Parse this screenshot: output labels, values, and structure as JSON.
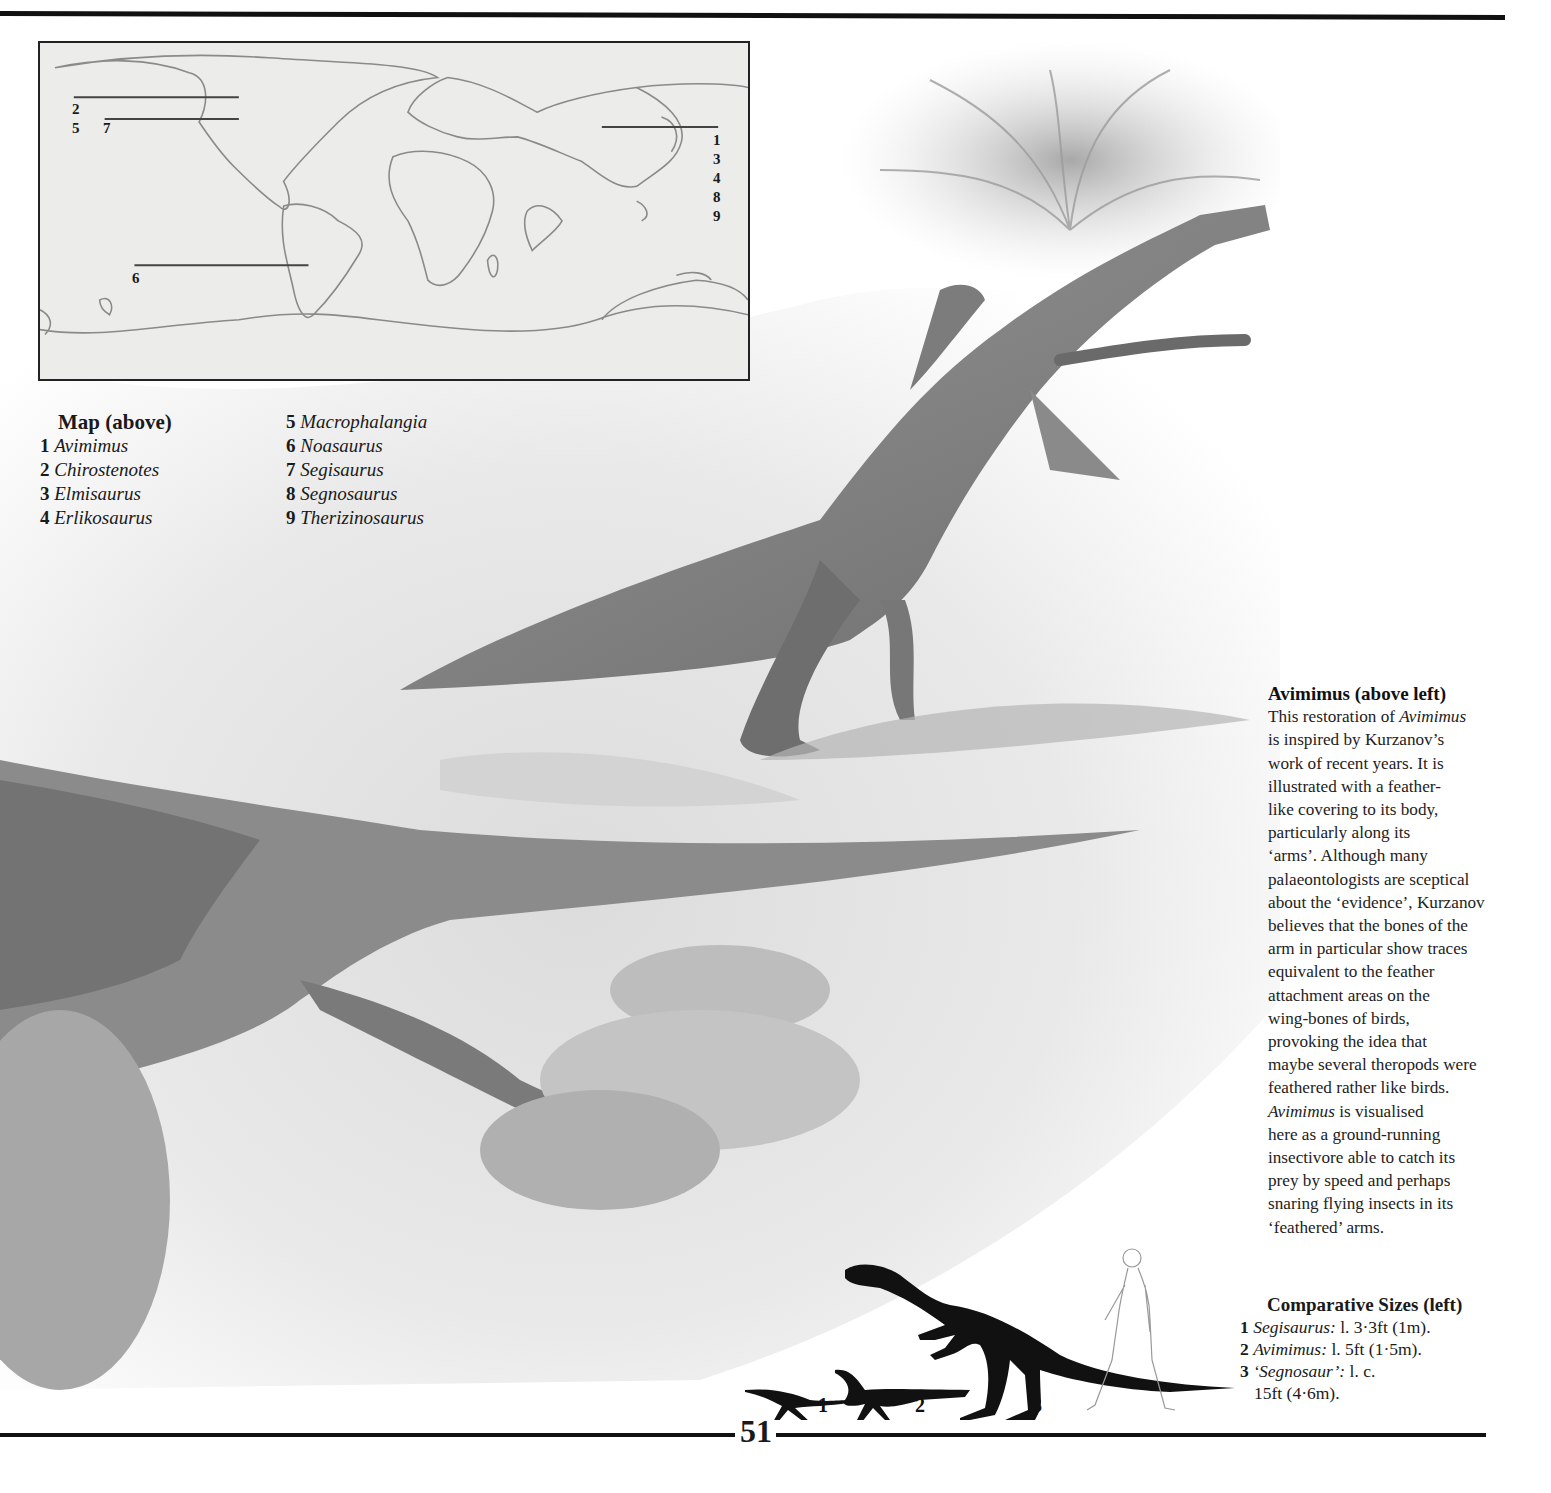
{
  "page": {
    "number": "51"
  },
  "map": {
    "markers": [
      {
        "labels": [
          "2"
        ],
        "line": "north-america-upper"
      },
      {
        "labels": [
          "5",
          "7"
        ],
        "line": "north-america-lower"
      },
      {
        "labels": [
          "1",
          "3",
          "4",
          "8",
          "9"
        ],
        "line": "asia"
      },
      {
        "labels": [
          "6"
        ],
        "line": "south-america"
      }
    ],
    "label_2": "2",
    "label_5": "5",
    "label_7": "7",
    "label_6": "6",
    "asia_labels": [
      "1",
      "3",
      "4",
      "8",
      "9"
    ]
  },
  "legend": {
    "title": "Map (above)",
    "items": [
      {
        "num": "1",
        "name": "Avimimus"
      },
      {
        "num": "2",
        "name": "Chirostenotes"
      },
      {
        "num": "3",
        "name": "Elmisaurus"
      },
      {
        "num": "4",
        "name": "Erlikosaurus"
      },
      {
        "num": "5",
        "name": "Macrophalangia"
      },
      {
        "num": "6",
        "name": "Noasaurus"
      },
      {
        "num": "7",
        "name": "Segisaurus"
      },
      {
        "num": "8",
        "name": "Segnosaurus"
      },
      {
        "num": "9",
        "name": "Therizinosaurus"
      }
    ]
  },
  "caption": {
    "heading": "Avimimus (above left)",
    "lines": [
      "This restoration of |Avimimus|",
      "is inspired by Kurzanov’s",
      "work of recent years. It is",
      "illustrated with a feather-",
      "like covering to its body,",
      "particularly along its",
      "‘arms’. Although many",
      "palaeontologists are sceptical",
      "about the ‘evidence’, Kurzanov",
      "believes that the bones of the",
      "arm in particular show traces",
      "equivalent to the feather",
      "attachment areas on the",
      "wing-bones of birds,",
      "provoking the idea that",
      "maybe several theropods were",
      "feathered rather like birds.",
      "|Avimimus| is visualised",
      "here as a ground-running",
      "insectivore able to catch its",
      "prey by speed and perhaps",
      "snaring flying insects in its",
      "‘feathered’ arms."
    ]
  },
  "comparative_sizes": {
    "heading": "Comparative Sizes (left)",
    "items": [
      {
        "num": "1",
        "name": "Segisaurus:",
        "size": " l. 3·3ft (1m)."
      },
      {
        "num": "2",
        "name": "Avimimus:",
        "size": " l. 5ft (1·5m)."
      },
      {
        "num": "3",
        "name": "‘Segnosaur’:",
        "size": " l. c. 15ft (4·6m)."
      }
    ],
    "silhouette_labels": [
      "1",
      "2",
      "3"
    ]
  },
  "colors": {
    "ink": "#111111",
    "map_bg": "#ececea",
    "coast": "#8a8a8a",
    "illustration_mid": "#9a9a9a"
  }
}
